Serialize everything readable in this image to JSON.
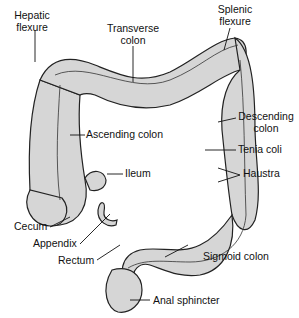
{
  "diagram": {
    "colors": {
      "tissue": "#d6d6d6",
      "outline": "#222222",
      "background": "#ffffff"
    },
    "labels": {
      "hepatic_flexure": [
        "Hepatic",
        "flexure"
      ],
      "transverse_colon": [
        "Transverse",
        "colon"
      ],
      "splenic_flexure": [
        "Splenic",
        "flexure"
      ],
      "ascending_colon": "Ascending colon",
      "descending_colon": [
        "Descending",
        "colon"
      ],
      "tenia_coli": "Tenia coli",
      "haustra": "Haustra",
      "ileum": "Ileum",
      "cecum": "Cecum",
      "appendix": "Appendix",
      "rectum": "Rectum",
      "sigmoid_colon": "Sigmoid colon",
      "anal_sphincter": "Anal sphincter"
    }
  }
}
